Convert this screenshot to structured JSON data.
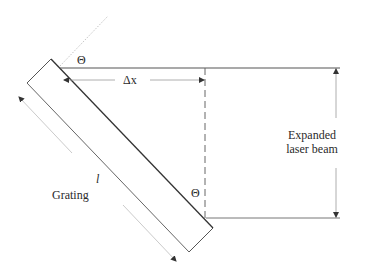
{
  "diagram": {
    "type": "optics-schematic",
    "title": "",
    "labels": {
      "theta_top": "Θ",
      "delta_x": "Δx",
      "theta_bottom": "Θ",
      "length": "l",
      "grating": "Grating",
      "beam_line1": "Expanded",
      "beam_line2": "laser beam"
    },
    "colors": {
      "line_dark": "#333333",
      "line_mid": "#777777",
      "line_light": "#bbbbbb",
      "text": "#2a2a2a",
      "background": "#ffffff"
    },
    "elements": [
      "grating (tilted rectangle)",
      "grating surface normal (dotted)",
      "top beam edge",
      "bottom beam edge",
      "dashed projection line",
      "delta-x dimension arrow",
      "beam-width dimension arrow",
      "grating length dimension arrows"
    ]
  }
}
